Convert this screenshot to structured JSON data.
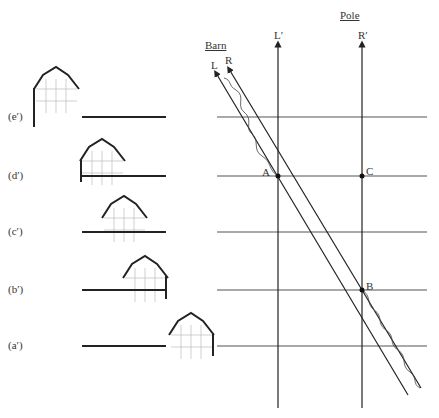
{
  "title_pole": "Pole",
  "title_barn": "Barn",
  "worldlines": {
    "L": "L",
    "R": "R",
    "Lp": "L′",
    "Rp": "R′"
  },
  "events": {
    "A": "A",
    "B": "B",
    "C": "C"
  },
  "frames": [
    {
      "label": "(e′)",
      "y": 117,
      "barn_x": 33
    },
    {
      "label": "(d′)",
      "y": 176,
      "barn_x": 80
    },
    {
      "label": "(c′)",
      "y": 232,
      "barn_x": 101
    },
    {
      "label": "(b′)",
      "y": 290,
      "barn_x": 122
    },
    {
      "label": "(a′)",
      "y": 346,
      "barn_x": 168
    }
  ],
  "colors": {
    "line": "#222222",
    "faint": "#bbbbbb"
  }
}
